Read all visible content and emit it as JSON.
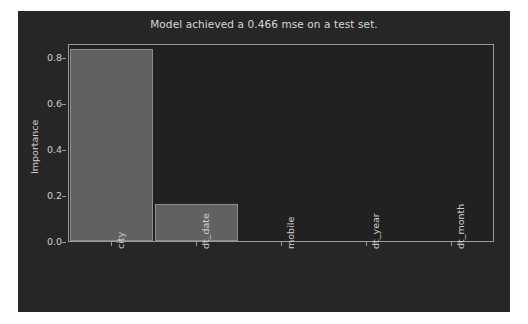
{
  "chart_data": {
    "type": "bar",
    "title": "Model achieved a 0.466 mse on a test set.",
    "xlabel": "",
    "ylabel": "Importance",
    "categories": [
      "city",
      "dt_date",
      "mobile",
      "dt_year",
      "dt_month"
    ],
    "values": [
      0.835,
      0.16,
      0.0,
      0.0,
      0.0
    ],
    "ylim": [
      0.0,
      0.86
    ],
    "yticks": [
      "0.0",
      "0.2",
      "0.4",
      "0.6",
      "0.8"
    ],
    "ytick_values": [
      0.0,
      0.2,
      0.4,
      0.6,
      0.8
    ],
    "grid": false,
    "legend": "none",
    "colors": {
      "figure_background": "#262626",
      "axes_background": "#212121",
      "bar_fill": "#616161",
      "bar_edge": "#8c8c8c",
      "axis_line": "#9a9a9a",
      "text": "#cfcfcf",
      "title_text": "#d8d8d8",
      "page_background": "#ffffff"
    }
  }
}
